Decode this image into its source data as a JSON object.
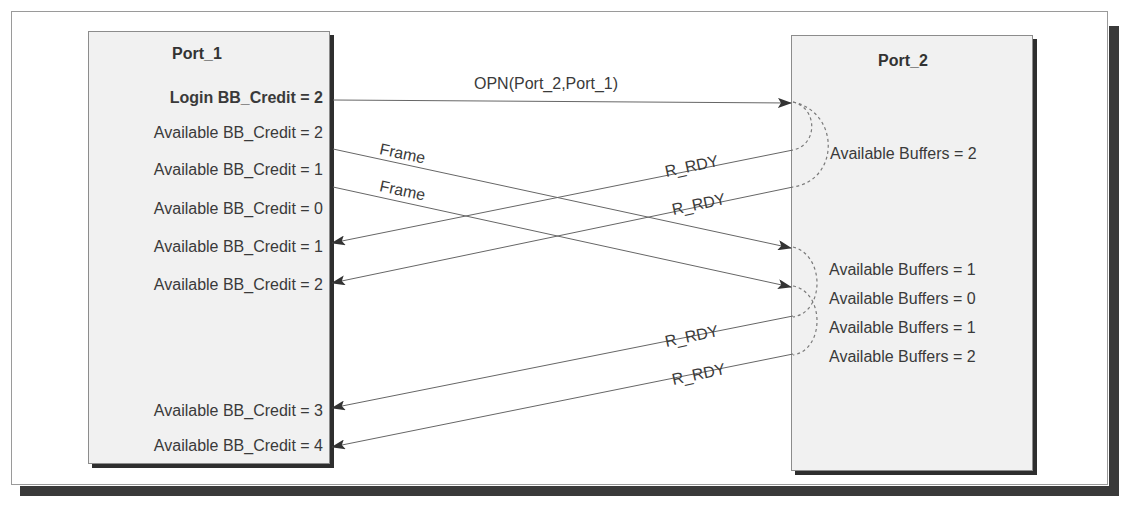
{
  "port1": {
    "title": "Port_1",
    "login_credit": "Login BB_Credit = 2",
    "credits": [
      "Available BB_Credit = 2",
      "Available BB_Credit = 1",
      "Available BB_Credit = 0",
      "Available BB_Credit = 1",
      "Available BB_Credit = 2",
      "Available BB_Credit = 3",
      "Available BB_Credit = 4"
    ]
  },
  "port2": {
    "title": "Port_2",
    "buffers": [
      "Available Buffers = 2",
      "Available Buffers = 1",
      "Available Buffers = 0",
      "Available Buffers = 1",
      "Available Buffers = 2"
    ]
  },
  "messages": {
    "opn": "OPN(Port_2,Port_1)",
    "frame_1": "Frame",
    "frame_2": "Frame",
    "r_rdy_1": "R_RDY",
    "r_rdy_2": "R_RDY",
    "r_rdy_3": "R_RDY",
    "r_rdy_4": "R_RDY"
  },
  "colors": {
    "line": "#555555",
    "arrowhead": "#333333",
    "box_fill": "#f1f1f1",
    "shadow": "#2e2e2e"
  }
}
